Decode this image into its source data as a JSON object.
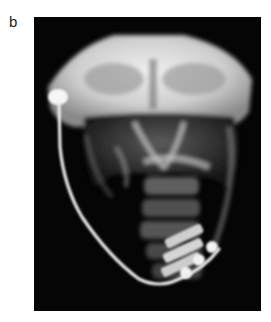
{
  "figure": {
    "panel_label": "b",
    "image": {
      "type": "radiograph",
      "view": "frontal skull and neck X-ray",
      "description": "Skull radiograph showing a shunt valve reservoir near the right temporal region with a radiopaque catheter tube running down the neck, curving toward a cervical fusion hardware region",
      "background_color": "#050505",
      "bone_color": "#e8e8e8",
      "hardware_color": "#f4f4f4"
    }
  }
}
